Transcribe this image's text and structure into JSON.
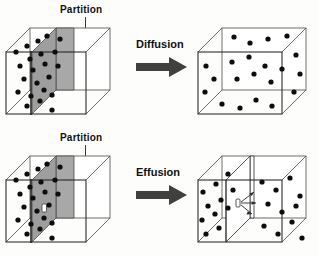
{
  "figure": {
    "background_color": "#fdfdfc",
    "outline_color": "#1a1a1a",
    "particle_color": "#0d0d0d",
    "partition_fill": "#a8a8a8",
    "partition_edge": "#4a4a4a",
    "arrow_color": "#404040",
    "label_color": "#111111"
  },
  "rows": [
    {
      "id": "diffusion",
      "partition_label": "Partition",
      "process_label": "Diffusion",
      "before": {
        "name": "box-with-solid-partition",
        "description": "particles confined to left compartment by a solid gray partition",
        "partition_type": "solid",
        "partition_has_hole": false,
        "particle_count": 22
      },
      "after": {
        "name": "box-uniformly-mixed",
        "description": "partition removed, particles spread evenly through whole box",
        "partition_type": "none",
        "particle_count": 21
      }
    },
    {
      "id": "effusion",
      "partition_label": "Partition",
      "process_label": "Effusion",
      "before": {
        "name": "box-with-perforated-partition",
        "description": "particles confined to left compartment by a gray partition containing a small hole",
        "partition_type": "solid",
        "partition_has_hole": true,
        "hole_label": "0",
        "particle_count": 22
      },
      "after": {
        "name": "box-with-particles-escaping-through-hole",
        "description": "particles escape through the small hole into the right compartment; arrows show outward flow",
        "partition_type": "thin",
        "partition_has_hole": true,
        "hole_label": "0",
        "escape_arrow_count": 3,
        "particle_count_left": 11,
        "particle_count_right": 11
      }
    }
  ],
  "particles": {
    "diffusion_before": [
      [
        16,
        52
      ],
      [
        27,
        46
      ],
      [
        38,
        41
      ],
      [
        47,
        36
      ],
      [
        30,
        59
      ],
      [
        41,
        54
      ],
      [
        20,
        66
      ],
      [
        33,
        70
      ],
      [
        45,
        64
      ],
      [
        24,
        79
      ],
      [
        37,
        83
      ],
      [
        49,
        77
      ],
      [
        18,
        92
      ],
      [
        31,
        96
      ],
      [
        44,
        90
      ],
      [
        27,
        106
      ],
      [
        40,
        101
      ],
      [
        52,
        95
      ],
      [
        55,
        52
      ],
      [
        58,
        66
      ],
      [
        60,
        85
      ],
      [
        52,
        110
      ]
    ],
    "diffusion_after": [
      [
        212,
        73
      ],
      [
        226,
        60
      ],
      [
        240,
        78
      ],
      [
        254,
        64
      ],
      [
        268,
        80
      ],
      [
        282,
        66
      ],
      [
        296,
        76
      ],
      [
        218,
        92
      ],
      [
        232,
        100
      ],
      [
        246,
        88
      ],
      [
        260,
        98
      ],
      [
        274,
        86
      ],
      [
        288,
        96
      ],
      [
        302,
        88
      ],
      [
        214,
        111
      ],
      [
        228,
        118
      ],
      [
        242,
        106
      ],
      [
        256,
        116
      ],
      [
        270,
        104
      ],
      [
        284,
        114
      ],
      [
        298,
        106
      ]
    ],
    "effusion_before": [
      [
        16,
        180
      ],
      [
        27,
        174
      ],
      [
        38,
        169
      ],
      [
        47,
        164
      ],
      [
        30,
        187
      ],
      [
        41,
        182
      ],
      [
        20,
        194
      ],
      [
        33,
        198
      ],
      [
        45,
        192
      ],
      [
        24,
        207
      ],
      [
        37,
        211
      ],
      [
        49,
        205
      ],
      [
        18,
        220
      ],
      [
        31,
        224
      ],
      [
        44,
        218
      ],
      [
        27,
        234
      ],
      [
        40,
        229
      ],
      [
        52,
        223
      ],
      [
        55,
        180
      ],
      [
        58,
        194
      ],
      [
        60,
        213
      ],
      [
        52,
        238
      ]
    ],
    "effusion_after_left": [
      [
        203,
        186
      ],
      [
        216,
        178
      ],
      [
        228,
        172
      ],
      [
        208,
        200
      ],
      [
        221,
        194
      ],
      [
        233,
        188
      ],
      [
        200,
        214
      ],
      [
        213,
        208
      ],
      [
        226,
        202
      ],
      [
        206,
        228
      ],
      [
        219,
        222
      ]
    ],
    "effusion_after_right": [
      [
        262,
        176
      ],
      [
        276,
        184
      ],
      [
        290,
        172
      ],
      [
        300,
        190
      ],
      [
        268,
        198
      ],
      [
        282,
        206
      ],
      [
        296,
        200
      ],
      [
        264,
        220
      ],
      [
        278,
        228
      ],
      [
        292,
        216
      ],
      [
        302,
        234
      ]
    ]
  }
}
